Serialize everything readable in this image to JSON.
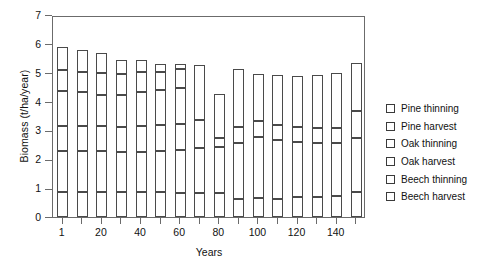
{
  "chart_data": {
    "type": "bar",
    "stacked": true,
    "title": "",
    "xlabel": "Years",
    "ylabel": "Biomass (t/ha/year)",
    "ylim": [
      0,
      7
    ],
    "ytick_labels": [
      "0",
      "1",
      "2",
      "3",
      "4",
      "5",
      "6",
      "7"
    ],
    "ytick_values": [
      0,
      1,
      2,
      3,
      4,
      5,
      6,
      7
    ],
    "xtick_labels": [
      "1",
      "20",
      "40",
      "60",
      "80",
      "100",
      "120",
      "140"
    ],
    "xtick_values": [
      1,
      20,
      40,
      60,
      80,
      100,
      120,
      140
    ],
    "grid": false,
    "legend_position": "right",
    "categories": [
      1,
      10,
      20,
      30,
      40,
      50,
      60,
      70,
      80,
      90,
      100,
      110,
      120,
      130,
      140,
      150
    ],
    "series": [
      {
        "name": "Beech harvest",
        "fill": "beech-harvest",
        "values": [
          0.88,
          0.88,
          0.88,
          0.88,
          0.88,
          0.85,
          0.84,
          0.84,
          0.82,
          0.62,
          0.65,
          0.62,
          0.68,
          0.7,
          0.72,
          0.86
        ]
      },
      {
        "name": "Beech thinning",
        "fill": "beech-thinning",
        "values": [
          1.42,
          1.4,
          1.42,
          1.36,
          1.38,
          1.44,
          1.48,
          1.56,
          1.62,
          1.96,
          2.13,
          2.06,
          1.92,
          1.88,
          1.86,
          1.88
        ]
      },
      {
        "name": "Oak harvest",
        "fill": "oak-harvest",
        "values": [
          0.87,
          0.88,
          0.86,
          0.88,
          0.9,
          0.9,
          0.92,
          0.96,
          0.31,
          0.55,
          0.54,
          0.52,
          0.52,
          0.51,
          0.5,
          0.92
        ]
      },
      {
        "name": "Oak thinning",
        "fill": "oak-thinning",
        "values": [
          1.18,
          1.16,
          1.08,
          1.12,
          1.18,
          1.22,
          1.24,
          1.92,
          1.52,
          2.0,
          1.64,
          1.72,
          1.78,
          1.82,
          1.92,
          1.68
        ]
      },
      {
        "name": "Pine harvest",
        "fill": "pine-harvest",
        "values": [
          0.73,
          0.71,
          0.74,
          0.71,
          0.7,
          0.62,
          0.65,
          0.0,
          0.0,
          0.0,
          0.0,
          0.0,
          0.0,
          0.0,
          0.0,
          0.0
        ]
      },
      {
        "name": "Pine thinning",
        "fill": "pine-thinning",
        "values": [
          0.82,
          0.75,
          0.72,
          0.48,
          0.4,
          0.28,
          0.18,
          0.0,
          0.0,
          0.0,
          0.0,
          0.0,
          0.0,
          0.0,
          0.0,
          0.0
        ]
      }
    ],
    "totals": [
      5.9,
      5.78,
      5.7,
      5.43,
      5.44,
      5.31,
      5.31,
      5.28,
      4.27,
      5.13,
      4.96,
      4.92,
      4.9,
      4.91,
      5.0,
      5.34
    ],
    "legend": [
      {
        "label": "Pine thinning",
        "fill": "pine-thinning"
      },
      {
        "label": "Pine harvest",
        "fill": "pine-harvest"
      },
      {
        "label": "Oak thinning",
        "fill": "oak-thinning"
      },
      {
        "label": "Oak harvest",
        "fill": "oak-harvest"
      },
      {
        "label": "Beech thinning",
        "fill": "beech-thinning"
      },
      {
        "label": "Beech harvest",
        "fill": "beech-harvest"
      }
    ],
    "colors": {
      "pine-thinning": "#ffffff",
      "pine-harvest": "#595959",
      "oak-thinning": "#9a9a9a",
      "oak-harvest": "#e4e4e4",
      "beech-thinning": "#d2d2d2",
      "beech-harvest": "#101010",
      "axis": "#6b6b6b",
      "text": "#111111"
    }
  }
}
